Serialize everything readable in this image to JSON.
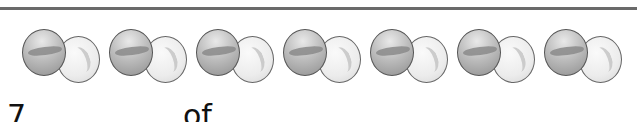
{
  "figure": {
    "marble_pairs": [
      {
        "left": 22
      },
      {
        "left": 109
      },
      {
        "left": 196
      },
      {
        "left": 283
      },
      {
        "left": 370
      },
      {
        "left": 457
      },
      {
        "left": 544
      }
    ],
    "marble_pair_count": 7,
    "colors": {
      "dark_marble": "#a6a6a6",
      "light_marble": "#ececec",
      "rule": "#6a6a6a"
    }
  },
  "question": {
    "number_text": "7",
    "connector_text": "of"
  }
}
